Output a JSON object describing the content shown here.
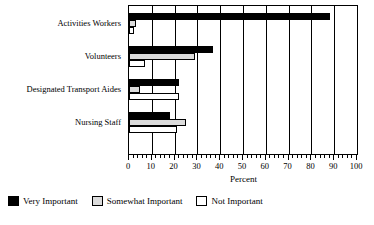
{
  "chart_data": {
    "type": "bar",
    "orientation": "horizontal",
    "title": "",
    "xlabel": "Percent",
    "ylabel": "",
    "xlim": [
      0,
      100
    ],
    "xticks": [
      0,
      10,
      20,
      30,
      40,
      50,
      60,
      70,
      80,
      90,
      100
    ],
    "xtick_labels": [
      "0",
      "10",
      "20",
      "30",
      "40",
      "50",
      "60",
      "70",
      "80",
      "90",
      "100"
    ],
    "minor_tick_step": 2,
    "grid": "vertical",
    "legend_position": "below-plot-left",
    "categories": [
      "Activities Workers",
      "Volunteers",
      "Designated Transport Aides",
      "Nursing Staff"
    ],
    "series": [
      {
        "name": "Very Important",
        "color": "#000000",
        "values": [
          88,
          37,
          22,
          18
        ]
      },
      {
        "name": "Somewhat Important",
        "color": "#dcdcdc",
        "values": [
          3,
          29,
          5,
          25
        ]
      },
      {
        "name": "Not Important",
        "color": "#ffffff",
        "values": [
          2,
          7,
          22,
          21
        ]
      }
    ]
  },
  "legend": {
    "items": [
      {
        "label": "Very Important"
      },
      {
        "label": "Somewhat Important"
      },
      {
        "label": "Not Important"
      }
    ]
  },
  "axis": {
    "x_title": "Percent"
  }
}
